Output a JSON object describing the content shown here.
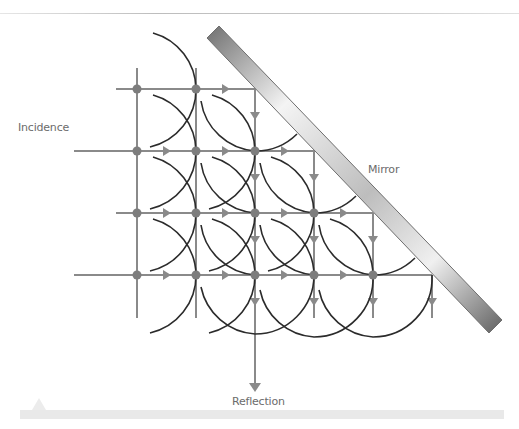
{
  "labels": {
    "incidence": "Incidence",
    "mirror": "Mirror",
    "reflection": "Reflection"
  },
  "colors": {
    "ray": "#8a8a8a",
    "node": "#7d7d7d",
    "wavefront": "#2b2b2b",
    "mirror_dark": "#7a7a7a",
    "mirror_light": "#f2f2f2",
    "text": "#6b6b6b"
  },
  "grid": {
    "columns_x": [
      137,
      196,
      255,
      314,
      373,
      432
    ],
    "rows_y": [
      89,
      151,
      213,
      275
    ],
    "spacing": 59
  },
  "mirror": {
    "from": [
      213,
      32
    ],
    "to": [
      495,
      326
    ],
    "thickness": 17
  }
}
